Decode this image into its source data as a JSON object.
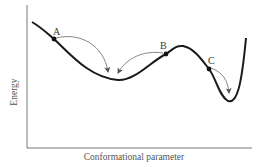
{
  "diagram": {
    "type": "energy-landscape",
    "axes": {
      "x_label": "Conformational parameter",
      "y_label": "Energy"
    },
    "points": [
      {
        "label": "A",
        "x": 54,
        "y": 39
      },
      {
        "label": "B",
        "x": 166,
        "y": 54
      },
      {
        "label": "C",
        "x": 209,
        "y": 69
      }
    ],
    "arrows": [
      {
        "from": "A",
        "to": "left-minimum"
      },
      {
        "from": "B",
        "to": "left-minimum"
      },
      {
        "from": "C",
        "to": "right-minimum"
      }
    ],
    "colors": {
      "curve": "#1a1a1a",
      "arrow": "#666666",
      "axis": "#777777",
      "text": "#3a3a3a"
    }
  }
}
